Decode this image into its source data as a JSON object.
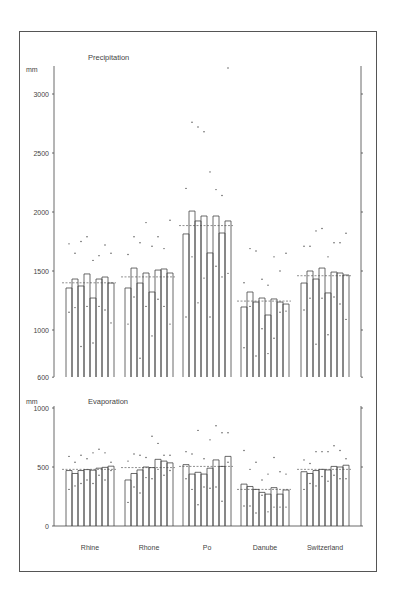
{
  "chart_data": [
    {
      "type": "bar",
      "title": "Precipitation",
      "ylabel": "mm",
      "xlabel": "",
      "ylim": [
        600,
        3200
      ],
      "yticks": [
        600,
        1000,
        1500,
        2000,
        2500,
        3000
      ],
      "grid": false,
      "categories": [
        "Rhine",
        "Rhone",
        "Po",
        "Danube",
        "Switzerland"
      ],
      "bars_per_category": 8,
      "series": [
        {
          "name": "Rhine",
          "values": [
            1356,
            1432,
            1373,
            1475,
            1271,
            1432,
            1449,
            1398
          ],
          "mean": 1400
        },
        {
          "name": "Rhone",
          "values": [
            1356,
            1525,
            1398,
            1483,
            1322,
            1508,
            1517,
            1483
          ],
          "mean": 1450
        },
        {
          "name": "Po",
          "values": [
            1814,
            2008,
            1924,
            1966,
            1653,
            1966,
            1822,
            1924
          ],
          "mean": 1885
        },
        {
          "name": "Danube",
          "values": [
            1195,
            1322,
            1237,
            1271,
            1127,
            1263,
            1237,
            1220
          ],
          "mean": 1245
        },
        {
          "name": "Switzerland",
          "values": [
            1398,
            1500,
            1432,
            1525,
            1314,
            1491,
            1483,
            1466
          ],
          "mean": 1460
        }
      ],
      "scatter_points": {
        "Rhine": [
          [
            0,
            1730
          ],
          [
            0,
            1150
          ],
          [
            1,
            1650
          ],
          [
            1,
            1190
          ],
          [
            2,
            1750
          ],
          [
            2,
            860
          ],
          [
            3,
            1790
          ],
          [
            3,
            1200
          ],
          [
            4,
            1590
          ],
          [
            4,
            890
          ],
          [
            5,
            1630
          ],
          [
            5,
            1200
          ],
          [
            6,
            1720
          ],
          [
            6,
            1170
          ],
          [
            7,
            1650
          ],
          [
            7,
            1060
          ]
        ],
        "Rhone": [
          [
            0,
            1640
          ],
          [
            0,
            1050
          ],
          [
            1,
            1790
          ],
          [
            1,
            1280
          ],
          [
            2,
            1740
          ],
          [
            2,
            760
          ],
          [
            3,
            1910
          ],
          [
            3,
            1200
          ],
          [
            4,
            1710
          ],
          [
            4,
            950
          ],
          [
            5,
            1790
          ],
          [
            5,
            1260
          ],
          [
            6,
            1690
          ],
          [
            6,
            1200
          ],
          [
            7,
            1930
          ],
          [
            7,
            1050
          ]
        ],
        "Po": [
          [
            0,
            2200
          ],
          [
            0,
            1110
          ],
          [
            1,
            2760
          ],
          [
            1,
            1620
          ],
          [
            2,
            2720
          ],
          [
            2,
            1230
          ],
          [
            3,
            2680
          ],
          [
            3,
            1440
          ],
          [
            4,
            2340
          ],
          [
            4,
            1110
          ],
          [
            5,
            2190
          ],
          [
            5,
            1540
          ],
          [
            6,
            2140
          ],
          [
            6,
            1450
          ],
          [
            7,
            3220
          ],
          [
            7,
            1480
          ]
        ],
        "Danube": [
          [
            0,
            1400
          ],
          [
            0,
            850
          ],
          [
            1,
            1690
          ],
          [
            1,
            1200
          ],
          [
            2,
            1670
          ],
          [
            2,
            780
          ],
          [
            3,
            1430
          ],
          [
            3,
            1010
          ],
          [
            4,
            1380
          ],
          [
            4,
            800
          ],
          [
            5,
            1620
          ],
          [
            5,
            930
          ],
          [
            6,
            1500
          ],
          [
            6,
            1150
          ],
          [
            7,
            1650
          ],
          [
            7,
            1160
          ]
        ],
        "Switzerland": [
          [
            0,
            1710
          ],
          [
            0,
            1170
          ],
          [
            1,
            1710
          ],
          [
            1,
            1270
          ],
          [
            2,
            1840
          ],
          [
            2,
            880
          ],
          [
            3,
            1860
          ],
          [
            3,
            1270
          ],
          [
            4,
            1620
          ],
          [
            4,
            960
          ],
          [
            5,
            1740
          ],
          [
            5,
            1280
          ],
          [
            6,
            1740
          ],
          [
            6,
            1220
          ],
          [
            7,
            1820
          ],
          [
            7,
            1090
          ]
        ]
      }
    },
    {
      "type": "bar",
      "title": "Evaporation",
      "ylabel": "mm",
      "xlabel": "",
      "ylim": [
        0,
        1000
      ],
      "yticks": [
        0,
        500,
        1000
      ],
      "grid": false,
      "categories": [
        "Rhine",
        "Rhone",
        "Po",
        "Danube",
        "Switzerland"
      ],
      "bars_per_category": 8,
      "series": [
        {
          "name": "Rhine",
          "values": [
            470,
            445,
            470,
            478,
            473,
            490,
            497,
            507
          ],
          "mean": 480
        },
        {
          "name": "Rhone",
          "values": [
            390,
            445,
            475,
            500,
            495,
            565,
            550,
            535
          ],
          "mean": 495
        },
        {
          "name": "Po",
          "values": [
            520,
            440,
            455,
            440,
            490,
            560,
            505,
            590
          ],
          "mean": 505
        },
        {
          "name": "Danube",
          "values": [
            355,
            335,
            310,
            285,
            270,
            325,
            270,
            305
          ],
          "mean": 310
        },
        {
          "name": "Switzerland",
          "values": [
            460,
            445,
            470,
            480,
            475,
            505,
            500,
            515
          ],
          "mean": 480
        }
      ],
      "scatter_points": {
        "Rhine": [
          [
            0,
            590
          ],
          [
            0,
            310
          ],
          [
            1,
            540
          ],
          [
            1,
            340
          ],
          [
            2,
            600
          ],
          [
            2,
            360
          ],
          [
            3,
            570
          ],
          [
            3,
            390
          ],
          [
            4,
            620
          ],
          [
            4,
            360
          ],
          [
            5,
            650
          ],
          [
            5,
            430
          ],
          [
            6,
            620
          ],
          [
            6,
            390
          ],
          [
            7,
            540
          ],
          [
            7,
            470
          ]
        ],
        "Rhone": [
          [
            0,
            550
          ],
          [
            0,
            200
          ],
          [
            1,
            610
          ],
          [
            1,
            330
          ],
          [
            2,
            600
          ],
          [
            2,
            280
          ],
          [
            3,
            580
          ],
          [
            3,
            410
          ],
          [
            4,
            760
          ],
          [
            4,
            400
          ],
          [
            5,
            700
          ],
          [
            5,
            480
          ],
          [
            6,
            600
          ],
          [
            6,
            430
          ],
          [
            7,
            600
          ],
          [
            7,
            470
          ]
        ],
        "Po": [
          [
            0,
            630
          ],
          [
            0,
            400
          ],
          [
            1,
            610
          ],
          [
            1,
            310
          ],
          [
            2,
            810
          ],
          [
            2,
            180
          ],
          [
            3,
            570
          ],
          [
            3,
            330
          ],
          [
            4,
            730
          ],
          [
            4,
            320
          ],
          [
            5,
            850
          ],
          [
            5,
            330
          ],
          [
            6,
            790
          ],
          [
            6,
            210
          ],
          [
            7,
            790
          ],
          [
            7,
            540
          ]
        ],
        "Danube": [
          [
            0,
            640
          ],
          [
            0,
            170
          ],
          [
            1,
            480
          ],
          [
            1,
            170
          ],
          [
            2,
            540
          ],
          [
            2,
            110
          ],
          [
            3,
            390
          ],
          [
            3,
            260
          ],
          [
            4,
            440
          ],
          [
            4,
            120
          ],
          [
            5,
            580
          ],
          [
            5,
            160
          ],
          [
            6,
            460
          ],
          [
            6,
            160
          ],
          [
            7,
            440
          ],
          [
            7,
            160
          ]
        ],
        "Switzerland": [
          [
            0,
            560
          ],
          [
            0,
            310
          ],
          [
            1,
            530
          ],
          [
            1,
            360
          ],
          [
            2,
            630
          ],
          [
            2,
            340
          ],
          [
            3,
            630
          ],
          [
            3,
            420
          ],
          [
            4,
            630
          ],
          [
            4,
            380
          ],
          [
            5,
            680
          ],
          [
            5,
            430
          ],
          [
            6,
            640
          ],
          [
            6,
            400
          ],
          [
            7,
            570
          ],
          [
            7,
            400
          ]
        ]
      }
    }
  ],
  "charts": {
    "precipitation": {
      "title": "Precipitation",
      "unit": "mm",
      "ticks": [
        "3000",
        "2500",
        "2000",
        "1500",
        "1000",
        "600"
      ]
    },
    "evaporation": {
      "title": "Evaporation",
      "unit": "mm",
      "ticks": [
        "1000",
        "500",
        "0"
      ]
    },
    "x_labels": [
      "Rhine",
      "Rhone",
      "Po",
      "Danube",
      "Switzerland"
    ]
  },
  "colors": {
    "line": "#444444",
    "frame": "#555555",
    "background": "#ffffff"
  }
}
